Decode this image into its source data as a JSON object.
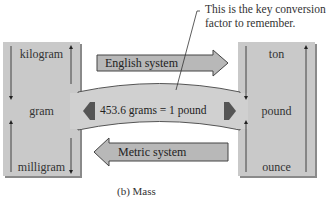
{
  "note": {
    "line1": "This is the key conversion",
    "line2": "factor to remember."
  },
  "metric_column": {
    "units": [
      "kilogram",
      "gram",
      "milligram"
    ]
  },
  "english_column": {
    "units": [
      "ton",
      "pound",
      "ounce"
    ]
  },
  "arrows": {
    "english_system": "English system",
    "metric_system": "Metric system"
  },
  "bridge": {
    "label": "453.6 grams = 1 pound"
  },
  "caption": "(b) Mass",
  "colors": {
    "column_fill": "#c9c9c9",
    "arrow_fill": "#b8b8b8",
    "bridge_fill": "#d0d0d0",
    "pointer_fill": "#555555"
  }
}
